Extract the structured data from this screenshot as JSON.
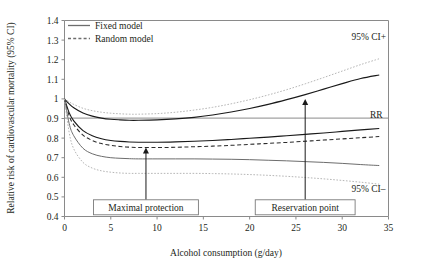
{
  "chart_data": {
    "type": "line",
    "title": "",
    "xlabel": "Alcohol consumption (g/day)",
    "ylabel": "Relative risk of cardiovascular mortality (95% CI)",
    "xlim": [
      0,
      35
    ],
    "ylim": [
      0.4,
      1.4
    ],
    "xticks": [
      "0",
      "5",
      "10",
      "15",
      "20",
      "25",
      "30",
      "35"
    ],
    "yticks": [
      "0.4",
      "0.5",
      "0.6",
      "0.7",
      "0.8",
      "0.9",
      "1",
      "1.1",
      "1.2",
      "1.3",
      "1.4"
    ],
    "grid": false,
    "legend_position": "top-left",
    "legend": [
      {
        "label": "Fixed model",
        "style": "solid"
      },
      {
        "label": "Random model",
        "style": "dashed"
      }
    ],
    "reference_line_y": 1.0,
    "series": [
      {
        "name": "Fixed model 95% CI upper",
        "style": "solid",
        "color": "#1a1a1a",
        "x": [
          0,
          0.5,
          1,
          2,
          3,
          4,
          5,
          6,
          7,
          8,
          10,
          12,
          14,
          16,
          18,
          20,
          22,
          24,
          26,
          28,
          30,
          32,
          34
        ],
        "y": [
          1.0,
          0.975,
          0.955,
          0.928,
          0.912,
          0.902,
          0.896,
          0.893,
          0.891,
          0.891,
          0.893,
          0.898,
          0.906,
          0.918,
          0.933,
          0.951,
          0.972,
          0.996,
          1.022,
          1.05,
          1.078,
          1.104,
          1.122
        ]
      },
      {
        "name": "Random model 95% CI upper",
        "style": "dotted-light",
        "color": "#b2b2b2",
        "x": [
          0,
          0.5,
          1,
          2,
          3,
          4,
          5,
          6,
          7,
          8,
          10,
          12,
          14,
          16,
          18,
          20,
          22,
          24,
          26,
          28,
          30,
          32,
          34
        ],
        "y": [
          1.0,
          0.985,
          0.972,
          0.952,
          0.94,
          0.932,
          0.927,
          0.924,
          0.922,
          0.922,
          0.925,
          0.932,
          0.943,
          0.957,
          0.975,
          0.996,
          1.02,
          1.047,
          1.077,
          1.109,
          1.142,
          1.175,
          1.205
        ]
      },
      {
        "name": "RR fixed model",
        "style": "solid",
        "color": "#1a1a1a",
        "x": [
          0,
          0.5,
          1,
          2,
          3,
          4,
          5,
          6,
          7,
          8,
          10,
          12,
          14,
          16,
          18,
          20,
          22,
          24,
          26,
          28,
          30,
          32,
          34
        ],
        "y": [
          1.0,
          0.93,
          0.888,
          0.838,
          0.812,
          0.797,
          0.788,
          0.783,
          0.78,
          0.779,
          0.779,
          0.781,
          0.784,
          0.788,
          0.793,
          0.799,
          0.805,
          0.812,
          0.819,
          0.826,
          0.834,
          0.842,
          0.849
        ]
      },
      {
        "name": "RR random model",
        "style": "dashed",
        "color": "#2b2b2b",
        "x": [
          0,
          0.5,
          1,
          2,
          3,
          4,
          5,
          6,
          7,
          8,
          10,
          12,
          14,
          16,
          18,
          20,
          22,
          24,
          26,
          28,
          30,
          32,
          34
        ],
        "y": [
          1.0,
          0.915,
          0.868,
          0.815,
          0.788,
          0.772,
          0.763,
          0.757,
          0.754,
          0.752,
          0.752,
          0.753,
          0.756,
          0.759,
          0.763,
          0.768,
          0.773,
          0.778,
          0.784,
          0.79,
          0.796,
          0.802,
          0.808
        ]
      },
      {
        "name": "Fixed model 95% CI lower",
        "style": "solid-mid",
        "color": "#6d6d6d",
        "x": [
          0,
          0.5,
          1,
          2,
          3,
          4,
          5,
          6,
          7,
          8,
          10,
          12,
          14,
          16,
          18,
          20,
          22,
          24,
          26,
          28,
          30,
          32,
          34
        ],
        "y": [
          1.0,
          0.875,
          0.812,
          0.748,
          0.72,
          0.707,
          0.7,
          0.697,
          0.695,
          0.694,
          0.694,
          0.694,
          0.694,
          0.693,
          0.692,
          0.69,
          0.687,
          0.684,
          0.68,
          0.676,
          0.671,
          0.665,
          0.66
        ]
      },
      {
        "name": "Random model 95% CI lower",
        "style": "dotted-light",
        "color": "#b2b2b2",
        "x": [
          0,
          0.5,
          1,
          2,
          3,
          4,
          5,
          6,
          7,
          8,
          10,
          12,
          14,
          16,
          18,
          20,
          22,
          24,
          26,
          28,
          30,
          32,
          34
        ],
        "y": [
          1.0,
          0.83,
          0.745,
          0.676,
          0.647,
          0.633,
          0.626,
          0.622,
          0.62,
          0.62,
          0.62,
          0.62,
          0.62,
          0.619,
          0.617,
          0.614,
          0.61,
          0.605,
          0.599,
          0.592,
          0.584,
          0.575,
          0.565
        ]
      }
    ],
    "series_labels": [
      {
        "text": "95% CI+",
        "x": 31.0,
        "y": 1.3
      },
      {
        "text": "RR",
        "x": 33.0,
        "y": 0.905
      },
      {
        "text": "95% CI–",
        "x": 31.0,
        "y": 0.527
      }
    ],
    "annotations": [
      {
        "text": "Maximal protection",
        "arrow_x": 8.8,
        "arrow_tip_y": 0.752,
        "box_y": 0.447
      },
      {
        "text": "Reservation point",
        "arrow_x": 26.0,
        "arrow_tip_y": 1.0,
        "box_y": 0.447
      }
    ]
  }
}
